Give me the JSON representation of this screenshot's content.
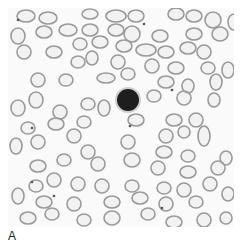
{
  "figure": {
    "panel_label": "A",
    "colors": {
      "background": "#fafafa",
      "rbc_stroke": "#9a9a9a",
      "rbc_fill": "#e2e2e2",
      "lymphocyte": "#1e1e1e",
      "platelet": "#555555"
    },
    "lymphocyte": {
      "cx": 120,
      "cy": 92,
      "r": 11
    },
    "rbcs": [
      [
        18,
        8,
        9,
        6
      ],
      [
        40,
        10,
        9,
        6
      ],
      [
        82,
        6,
        8,
        5
      ],
      [
        108,
        8,
        10,
        6
      ],
      [
        128,
        8,
        8,
        6
      ],
      [
        168,
        6,
        8,
        6
      ],
      [
        186,
        8,
        8,
        6
      ],
      [
        205,
        12,
        8,
        8
      ],
      [
        226,
        14,
        6,
        8
      ],
      [
        10,
        28,
        7,
        8
      ],
      [
        36,
        24,
        8,
        6
      ],
      [
        60,
        22,
        9,
        6
      ],
      [
        82,
        22,
        8,
        6
      ],
      [
        108,
        22,
        8,
        6
      ],
      [
        124,
        26,
        8,
        8
      ],
      [
        152,
        28,
        8,
        6
      ],
      [
        186,
        26,
        8,
        6
      ],
      [
        212,
        26,
        8,
        7
      ],
      [
        16,
        44,
        7,
        7
      ],
      [
        46,
        44,
        8,
        6
      ],
      [
        72,
        36,
        7,
        6
      ],
      [
        92,
        34,
        8,
        6
      ],
      [
        116,
        38,
        8,
        6
      ],
      [
        138,
        42,
        10,
        6
      ],
      [
        158,
        44,
        8,
        6
      ],
      [
        180,
        40,
        8,
        6
      ],
      [
        196,
        44,
        7,
        7
      ],
      [
        70,
        54,
        7,
        6
      ],
      [
        84,
        50,
        6,
        7
      ],
      [
        110,
        54,
        7,
        7
      ],
      [
        144,
        58,
        7,
        7
      ],
      [
        168,
        60,
        8,
        6
      ],
      [
        200,
        60,
        7,
        6
      ],
      [
        220,
        62,
        6,
        8
      ],
      [
        30,
        72,
        7,
        7
      ],
      [
        58,
        72,
        7,
        6
      ],
      [
        98,
        70,
        9,
        5
      ],
      [
        120,
        66,
        7,
        6
      ],
      [
        158,
        74,
        8,
        6
      ],
      [
        180,
        78,
        6,
        7
      ],
      [
        208,
        74,
        6,
        8
      ],
      [
        28,
        92,
        7,
        8
      ],
      [
        10,
        100,
        7,
        8
      ],
      [
        52,
        104,
        7,
        7
      ],
      [
        80,
        96,
        7,
        6
      ],
      [
        96,
        100,
        6,
        8
      ],
      [
        146,
        88,
        7,
        6
      ],
      [
        176,
        90,
        7,
        7
      ],
      [
        206,
        92,
        6,
        7
      ],
      [
        20,
        120,
        7,
        6
      ],
      [
        48,
        116,
        8,
        6
      ],
      [
        76,
        114,
        7,
        6
      ],
      [
        128,
        112,
        8,
        6
      ],
      [
        166,
        112,
        8,
        6
      ],
      [
        188,
        112,
        7,
        7
      ],
      [
        30,
        134,
        7,
        7
      ],
      [
        66,
        128,
        7,
        7
      ],
      [
        120,
        134,
        7,
        7
      ],
      [
        158,
        128,
        7,
        7
      ],
      [
        176,
        124,
        6,
        6
      ],
      [
        196,
        128,
        6,
        10
      ],
      [
        8,
        138,
        6,
        8
      ],
      [
        80,
        144,
        7,
        7
      ],
      [
        124,
        152,
        8,
        7
      ],
      [
        156,
        144,
        8,
        6
      ],
      [
        180,
        148,
        7,
        6
      ],
      [
        218,
        150,
        6,
        7
      ],
      [
        30,
        158,
        8,
        6
      ],
      [
        56,
        152,
        7,
        6
      ],
      [
        90,
        156,
        7,
        7
      ],
      [
        150,
        160,
        7,
        7
      ],
      [
        180,
        164,
        8,
        6
      ],
      [
        210,
        160,
        7,
        7
      ],
      [
        28,
        178,
        7,
        6
      ],
      [
        46,
        172,
        7,
        7
      ],
      [
        70,
        176,
        7,
        7
      ],
      [
        94,
        178,
        7,
        7
      ],
      [
        124,
        178,
        7,
        6
      ],
      [
        156,
        180,
        7,
        6
      ],
      [
        176,
        182,
        7,
        7
      ],
      [
        202,
        176,
        7,
        7
      ],
      [
        10,
        188,
        6,
        8
      ],
      [
        36,
        194,
        8,
        6
      ],
      [
        66,
        196,
        7,
        7
      ],
      [
        104,
        194,
        8,
        6
      ],
      [
        132,
        190,
        8,
        6
      ],
      [
        158,
        196,
        7,
        7
      ],
      [
        188,
        194,
        7,
        6
      ],
      [
        220,
        186,
        6,
        7
      ],
      [
        20,
        210,
        8,
        6
      ],
      [
        44,
        206,
        7,
        6
      ],
      [
        76,
        212,
        7,
        6
      ],
      [
        104,
        210,
        8,
        7
      ],
      [
        140,
        206,
        7,
        6
      ],
      [
        166,
        214,
        8,
        6
      ],
      [
        196,
        212,
        7,
        7
      ],
      [
        218,
        210,
        6,
        6
      ]
    ],
    "platelets": [
      [
        10,
        12
      ],
      [
        136,
        16
      ],
      [
        122,
        118
      ],
      [
        24,
        174
      ],
      [
        46,
        188
      ],
      [
        154,
        200
      ],
      [
        164,
        82
      ],
      [
        24,
        120
      ]
    ]
  }
}
